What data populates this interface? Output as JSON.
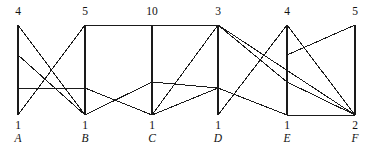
{
  "figure": {
    "type": "network-diagram",
    "width": 374,
    "height": 144,
    "background_color": "#ffffff",
    "line_color": "#1a1a1a",
    "axis_color": "#1a1a1a"
  },
  "axes": [
    {
      "id": "A",
      "letter": "A",
      "top_value": "4",
      "bottom_value": "1",
      "x": 18,
      "y_top": 25,
      "y_bottom": 115
    },
    {
      "id": "B",
      "letter": "B",
      "top_value": "5",
      "bottom_value": "1",
      "x": 85,
      "y_top": 25,
      "y_bottom": 115
    },
    {
      "id": "C",
      "letter": "C",
      "top_value": "10",
      "bottom_value": "1",
      "x": 152,
      "y_top": 25,
      "y_bottom": 115
    },
    {
      "id": "D",
      "letter": "D",
      "top_value": "3",
      "bottom_value": "1",
      "x": 218,
      "y_top": 25,
      "y_bottom": 115
    },
    {
      "id": "E",
      "letter": "E",
      "top_value": "4",
      "bottom_value": "1",
      "x": 287,
      "y_top": 25,
      "y_bottom": 115
    },
    {
      "id": "F",
      "letter": "F",
      "top_value": "5",
      "bottom_value": "2",
      "x": 355,
      "y_top": 25,
      "y_bottom": 115
    }
  ],
  "chart_data": {
    "type": "line",
    "title": "",
    "xlabel": "",
    "ylabel": "",
    "categories": [
      "A",
      "B",
      "C",
      "D",
      "E",
      "F"
    ],
    "top_values": [
      4,
      5,
      10,
      3,
      4,
      5
    ],
    "bottom_values": [
      1,
      1,
      1,
      1,
      1,
      2
    ],
    "x_positions": [
      18,
      85,
      152,
      218,
      287,
      355
    ],
    "node_levels": {
      "top": 25,
      "upper": 55,
      "mid": 82,
      "low": 88,
      "bottom": 115
    },
    "edges": [
      {
        "from": "A",
        "fy": 25,
        "to": "B",
        "ty": 115
      },
      {
        "from": "A",
        "fy": 55,
        "to": "B",
        "ty": 115
      },
      {
        "from": "A",
        "fy": 88,
        "to": "B",
        "ty": 88
      },
      {
        "from": "A",
        "fy": 115,
        "to": "B",
        "ty": 25
      },
      {
        "from": "B",
        "fy": 25,
        "to": "D",
        "ty": 25
      },
      {
        "from": "B",
        "fy": 88,
        "to": "C",
        "ty": 115
      },
      {
        "from": "B",
        "fy": 115,
        "to": "C",
        "ty": 82
      },
      {
        "from": "C",
        "fy": 82,
        "to": "D",
        "ty": 88
      },
      {
        "from": "C",
        "fy": 115,
        "to": "D",
        "ty": 25
      },
      {
        "from": "C",
        "fy": 115,
        "to": "D",
        "ty": 88
      },
      {
        "from": "D",
        "fy": 25,
        "to": "E",
        "ty": 82
      },
      {
        "from": "D",
        "fy": 25,
        "to": "F",
        "ty": 115
      },
      {
        "from": "D",
        "fy": 88,
        "to": "E",
        "ty": 115
      },
      {
        "from": "D",
        "fy": 115,
        "to": "E",
        "ty": 25
      },
      {
        "from": "E",
        "fy": 25,
        "to": "F",
        "ty": 115
      },
      {
        "from": "E",
        "fy": 55,
        "to": "F",
        "ty": 25
      },
      {
        "from": "E",
        "fy": 82,
        "to": "F",
        "ty": 115
      },
      {
        "from": "E",
        "fy": 115,
        "to": "F",
        "ty": 115
      }
    ]
  }
}
